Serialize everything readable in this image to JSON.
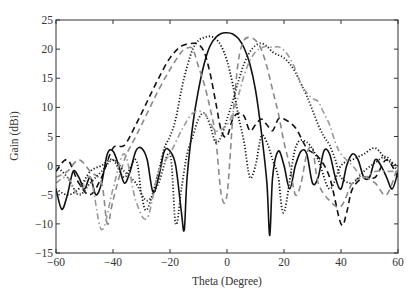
{
  "chart_data": {
    "type": "line",
    "title": "",
    "xlabel": "Theta (Degree)",
    "ylabel": "Gain (dBi)",
    "xlim": [
      -60,
      60
    ],
    "ylim": [
      -15,
      25
    ],
    "xticks": [
      -60,
      -40,
      -20,
      0,
      20,
      40,
      60
    ],
    "yticks": [
      -15,
      -10,
      -5,
      0,
      5,
      10,
      15,
      20,
      25
    ],
    "xtick_labels": [
      "−60",
      "−40",
      "−20",
      "0",
      "20",
      "40",
      "60"
    ],
    "ytick_labels": [
      "−15",
      "−10",
      "−5",
      "0",
      "5",
      "10",
      "15",
      "20",
      "25"
    ],
    "grid": false,
    "legend": null,
    "series": [
      {
        "name": "solid-black",
        "style": "solid",
        "color": "#111111",
        "x": [
          -60,
          -58,
          -56,
          -54,
          -52,
          -50,
          -48,
          -46,
          -44,
          -42,
          -40,
          -38,
          -36,
          -34,
          -32,
          -30,
          -28,
          -26,
          -24,
          -22,
          -20,
          -18,
          -16,
          -15,
          -14,
          -12,
          -10,
          -8,
          -6,
          -4,
          -2,
          0,
          2,
          4,
          6,
          8,
          10,
          12,
          14,
          15,
          16,
          18,
          20,
          22,
          24,
          26,
          28,
          30,
          32,
          34,
          36,
          38,
          40,
          42,
          44,
          46,
          48,
          50,
          52,
          54,
          56,
          58,
          60
        ],
        "y": [
          -4,
          -7.5,
          -5,
          -1,
          -2,
          -4,
          -2,
          -5,
          -3,
          2,
          2.5,
          0,
          -3,
          -1,
          2.5,
          3,
          1,
          -4.5,
          -2,
          2.5,
          2.5,
          0,
          -8,
          -11,
          -2,
          7,
          13,
          17.5,
          20.5,
          22,
          22.7,
          22.8,
          22.6,
          21.8,
          20.2,
          17.5,
          13,
          6,
          -3,
          -12,
          -2,
          2.5,
          0,
          -4,
          0,
          2.5,
          2,
          -3,
          -2,
          2.5,
          2,
          -2,
          -4,
          0,
          2,
          1,
          -2,
          -2,
          1,
          0,
          -2,
          -4,
          -1
        ]
      },
      {
        "name": "dashed-black",
        "style": "dashed",
        "color": "#111111",
        "x": [
          -60,
          -56,
          -52,
          -48,
          -44,
          -40,
          -36,
          -32,
          -28,
          -24,
          -20,
          -16,
          -12,
          -10,
          -8,
          -6,
          -4,
          -2,
          0,
          2,
          4,
          6,
          8,
          10,
          12,
          14,
          16,
          18,
          20,
          24,
          28,
          32,
          36,
          40,
          42,
          44,
          48,
          52,
          56,
          60
        ],
        "y": [
          -1,
          1,
          -3,
          -5,
          -2,
          3,
          3.5,
          7,
          11,
          15,
          18.5,
          20.5,
          21,
          20.8,
          19.5,
          16,
          11,
          6,
          5,
          8,
          9,
          8.5,
          6,
          7,
          8,
          7,
          6,
          8,
          8,
          6.5,
          3,
          1.5,
          -2,
          -10,
          -8,
          -4,
          -2,
          -2,
          1,
          -2
        ]
      },
      {
        "name": "dashed-gray",
        "style": "dashed",
        "color": "#8a8a8a",
        "x": [
          -60,
          -56,
          -52,
          -48,
          -44,
          -42,
          -40,
          -36,
          -32,
          -28,
          -24,
          -20,
          -16,
          -14,
          -12,
          -10,
          -8,
          -6,
          -4,
          -2,
          0,
          2,
          4,
          6,
          8,
          10,
          12,
          14,
          16,
          18,
          20,
          22,
          24,
          26,
          28,
          30,
          32,
          36,
          40,
          44,
          48,
          52,
          56,
          60
        ],
        "y": [
          -2,
          -1,
          1,
          -1,
          -3,
          -10,
          -6,
          1,
          5,
          9,
          13,
          16.5,
          19.5,
          20.2,
          20,
          17,
          14,
          10,
          5,
          -5,
          -5,
          8,
          18,
          21.5,
          22,
          21.5,
          20,
          17,
          13,
          9,
          4,
          0,
          -5,
          -3,
          2,
          3,
          -3,
          -6,
          -7,
          -3,
          -2,
          -3,
          -5,
          0
        ]
      },
      {
        "name": "dotted-black-left",
        "style": "dotted",
        "color": "#111111",
        "x": [
          -60,
          -56,
          -52,
          -48,
          -44,
          -40,
          -36,
          -32,
          -30,
          -28,
          -24,
          -22,
          -20,
          -18,
          -16,
          -14,
          -12,
          -10,
          -8,
          -6,
          -4,
          -2,
          0,
          2,
          4,
          6,
          8,
          10,
          12,
          14,
          16,
          18,
          20,
          24,
          28,
          32,
          36,
          40,
          44,
          48,
          52,
          56,
          60
        ],
        "y": [
          -4,
          -5,
          -4,
          -1,
          0,
          1,
          -2,
          1,
          -5,
          -7.5,
          -1,
          3,
          5,
          8,
          13,
          17,
          20,
          21.5,
          22,
          22.2,
          21.8,
          20.5,
          18,
          14,
          8.5,
          4,
          -2,
          0,
          5,
          4,
          1,
          -2,
          -8,
          3,
          4,
          1,
          -4,
          0,
          1,
          2,
          3,
          1,
          0
        ]
      },
      {
        "name": "dotted-black-right",
        "style": "dotted",
        "color": "#222222",
        "x": [
          -60,
          -56,
          -52,
          -48,
          -44,
          -40,
          -36,
          -32,
          -28,
          -24,
          -20,
          -18,
          -16,
          -14,
          -12,
          -10,
          -8,
          -6,
          -4,
          -2,
          0,
          2,
          4,
          6,
          8,
          10,
          12,
          14,
          16,
          18,
          20,
          22,
          24,
          26,
          28,
          30,
          32,
          34,
          36,
          38,
          40,
          44,
          48,
          52,
          56,
          60
        ],
        "y": [
          0,
          -2,
          -5,
          -3,
          -1,
          1,
          -1,
          -3,
          -6,
          -3,
          2,
          -10,
          -4,
          2,
          5,
          8,
          9,
          7,
          4,
          5,
          8,
          11,
          14.5,
          17.5,
          19.5,
          20.6,
          21,
          20.5,
          19.5,
          19,
          18.5,
          17.5,
          16,
          14,
          12,
          9.5,
          7,
          5,
          3.5,
          1,
          -2,
          -3,
          -1,
          0.5,
          1.5,
          -1
        ]
      },
      {
        "name": "dashdot-gray",
        "style": "dashdot",
        "color": "#9a9a9a",
        "x": [
          -60,
          -56,
          -52,
          -48,
          -44,
          -40,
          -36,
          -32,
          -28,
          -24,
          -20,
          -16,
          -12,
          -8,
          -4,
          0,
          2,
          4,
          6,
          8,
          10,
          12,
          14,
          16,
          18,
          20,
          22,
          24,
          26,
          28,
          30,
          32,
          34,
          36,
          38,
          40,
          44,
          48,
          52,
          56,
          60
        ],
        "y": [
          -3,
          -2,
          -5,
          -2,
          -11,
          -4,
          2,
          -6,
          -9,
          -1,
          2,
          6,
          9,
          9,
          6,
          7,
          9,
          12,
          15.5,
          18,
          19.5,
          20.2,
          20.5,
          20.3,
          20.4,
          19.8,
          18.5,
          16.5,
          14,
          12.5,
          11.5,
          11,
          9,
          7,
          4,
          2,
          0,
          -2,
          -1,
          -1,
          -1
        ]
      }
    ]
  }
}
